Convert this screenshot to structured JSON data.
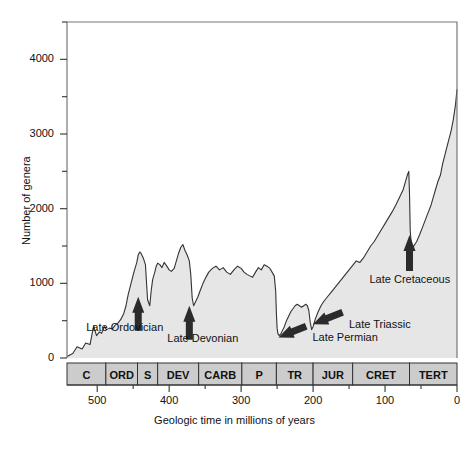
{
  "chart_data": {
    "type": "area",
    "title": "",
    "xlabel": "Geologic time in millions of years",
    "ylabel": "Number of genera",
    "xlim": [
      542,
      0
    ],
    "ylim": [
      0,
      4500
    ],
    "x_reversed": true,
    "x_ticks_major": [
      500,
      400,
      300,
      200,
      100,
      0
    ],
    "x_ticks_minor": [
      450,
      350,
      250,
      150,
      50
    ],
    "y_ticks_major": [
      0,
      1000,
      2000,
      3000,
      4000
    ],
    "y_ticks_minor": [
      500,
      1500,
      2500,
      3500,
      4500
    ],
    "grid": false,
    "legend": null,
    "series_name": "Marine animal genera",
    "fill_color": "#e6e6e6",
    "line_color": "#333333",
    "x": [
      542,
      534,
      528,
      521,
      516,
      510,
      505,
      501,
      497,
      494,
      490,
      487,
      483,
      479,
      475,
      471,
      467,
      463,
      460,
      457,
      453,
      449,
      445,
      443,
      441,
      439,
      436,
      433,
      430,
      427,
      425,
      423,
      420,
      418,
      416,
      413,
      410,
      407,
      404,
      400,
      397,
      393,
      390,
      387,
      384,
      381,
      378,
      375,
      372,
      370,
      368,
      366,
      363,
      360,
      357,
      353,
      349,
      345,
      340,
      335,
      330,
      325,
      320,
      315,
      310,
      305,
      300,
      296,
      292,
      288,
      284,
      280,
      276,
      272,
      268,
      264,
      260,
      257,
      254,
      252,
      251,
      250,
      249,
      247,
      245,
      243,
      240,
      237,
      234,
      231,
      228,
      225,
      222,
      219,
      216,
      213,
      210,
      208,
      206,
      204,
      202,
      200,
      197,
      193,
      189,
      185,
      180,
      175,
      170,
      165,
      160,
      155,
      150,
      145,
      140,
      135,
      130,
      125,
      120,
      115,
      110,
      105,
      100,
      95,
      90,
      85,
      80,
      75,
      72,
      69,
      67,
      66,
      65,
      63,
      60,
      56,
      52,
      48,
      44,
      40,
      36,
      33,
      30,
      27,
      23,
      20,
      16,
      12,
      8,
      5,
      2,
      0
    ],
    "y": [
      20,
      60,
      150,
      120,
      200,
      180,
      430,
      300,
      350,
      330,
      420,
      380,
      400,
      390,
      440,
      470,
      520,
      600,
      700,
      850,
      1000,
      1150,
      1280,
      1380,
      1420,
      1400,
      1340,
      1250,
      780,
      700,
      900,
      1050,
      1150,
      1230,
      1270,
      1250,
      1210,
      1280,
      1240,
      1180,
      1160,
      1200,
      1300,
      1400,
      1480,
      1520,
      1440,
      1380,
      1300,
      1120,
      800,
      700,
      760,
      820,
      900,
      1000,
      1080,
      1150,
      1200,
      1230,
      1180,
      1210,
      1150,
      1120,
      1180,
      1230,
      1200,
      1150,
      1120,
      1100,
      1080,
      1150,
      1210,
      1180,
      1250,
      1230,
      1200,
      1150,
      1100,
      900,
      600,
      400,
      330,
      300,
      320,
      360,
      420,
      500,
      560,
      620,
      660,
      700,
      720,
      700,
      680,
      700,
      720,
      700,
      640,
      480,
      380,
      420,
      520,
      620,
      700,
      760,
      820,
      880,
      940,
      1000,
      1060,
      1120,
      1180,
      1240,
      1300,
      1280,
      1340,
      1420,
      1500,
      1560,
      1640,
      1720,
      1800,
      1880,
      1960,
      2050,
      2150,
      2250,
      2350,
      2450,
      2500,
      2200,
      1700,
      1480,
      1500,
      1560,
      1650,
      1750,
      1850,
      1950,
      2050,
      2150,
      2250,
      2350,
      2450,
      2600,
      2750,
      2900,
      3050,
      3200,
      3400,
      3600,
      3850,
      4100,
      4300
    ],
    "annotations": [
      {
        "label": "Late Ordovician",
        "arrow": "up",
        "at_x": 443,
        "at_y": 900
      },
      {
        "label": "Late Devonian",
        "arrow": "up",
        "at_x": 372,
        "at_y": 780
      },
      {
        "label": "Late Permian",
        "arrow": "left",
        "at_x": 251,
        "at_y": 330
      },
      {
        "label": "Late Triassic",
        "arrow": "left",
        "at_x": 203,
        "at_y": 480
      },
      {
        "label": "Late Cretaceous",
        "arrow": "up",
        "at_x": 66,
        "at_y": 1700
      }
    ],
    "period_bar": {
      "name": "Geologic periods",
      "cells": [
        {
          "label": "C",
          "start": 542,
          "end": 488
        },
        {
          "label": "ORD",
          "start": 488,
          "end": 444
        },
        {
          "label": "S",
          "start": 444,
          "end": 416
        },
        {
          "label": "DEV",
          "start": 416,
          "end": 359
        },
        {
          "label": "CARB",
          "start": 359,
          "end": 299
        },
        {
          "label": "P",
          "start": 299,
          "end": 251
        },
        {
          "label": "TR",
          "start": 251,
          "end": 200
        },
        {
          "label": "JUR",
          "start": 200,
          "end": 145
        },
        {
          "label": "CRET",
          "start": 145,
          "end": 66
        },
        {
          "label": "TERT",
          "start": 66,
          "end": 0
        }
      ]
    }
  }
}
